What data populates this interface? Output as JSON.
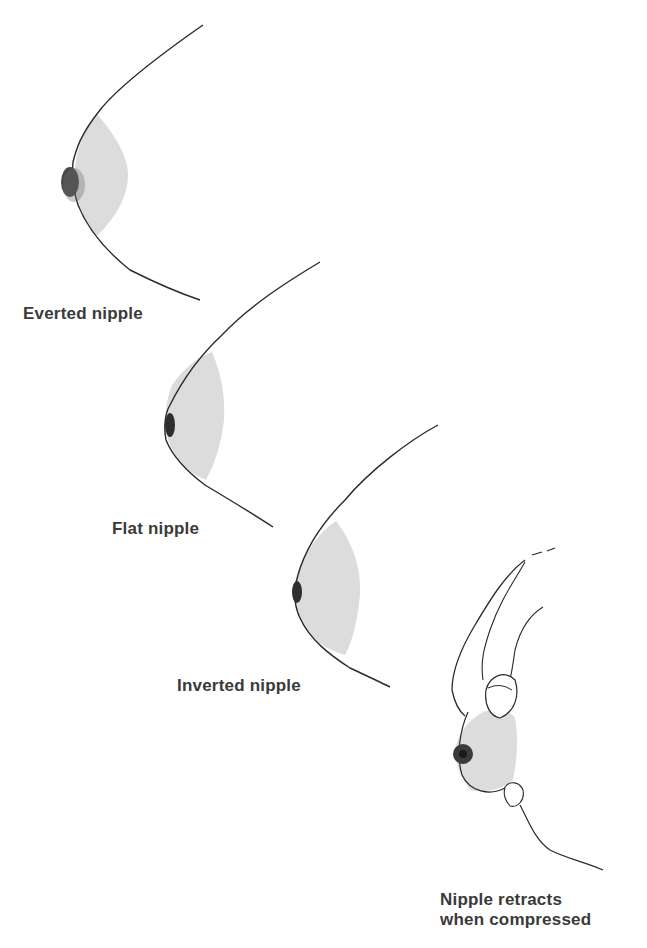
{
  "figure": {
    "panels": [
      {
        "id": "everted",
        "label": "Everted nipple"
      },
      {
        "id": "flat",
        "label": "Flat nipple"
      },
      {
        "id": "inverted",
        "label": "Inverted nipple"
      },
      {
        "id": "compressed",
        "label_line1": "Nipple retracts",
        "label_line2": "when compressed"
      }
    ],
    "colors": {
      "areola_fill": "#dcdcdc",
      "outline": "#2a2a2a",
      "nipple": "#3a3a3a",
      "text": "#3a3a3a"
    }
  }
}
